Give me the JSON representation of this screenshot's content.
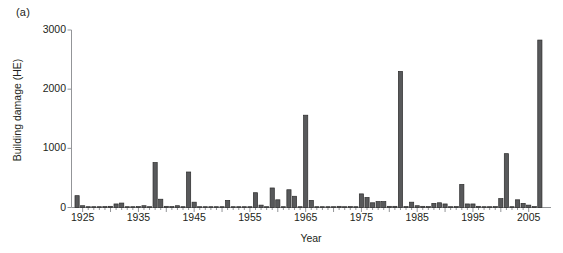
{
  "figure": {
    "panel_label": "(a)",
    "background": "#ffffff"
  },
  "chart_data": {
    "type": "bar",
    "title": "",
    "panel_label": "(a)",
    "xlabel": "Year",
    "ylabel": "Building damage (HE)",
    "xlim": [
      1923,
      2009
    ],
    "ylim": [
      0,
      3000
    ],
    "yticks": [
      0,
      1000,
      2000,
      3000
    ],
    "xticks": [
      1925,
      1930,
      1935,
      1940,
      1945,
      1950,
      1955,
      1960,
      1965,
      1970,
      1975,
      1980,
      1985,
      1990,
      1995,
      2000,
      2005
    ],
    "xtick_labels_shown": [
      1925,
      1935,
      1945,
      1955,
      1965,
      1975,
      1985,
      1995,
      2005
    ],
    "minor_xticks_interval": 1,
    "grid": false,
    "legend": null,
    "bar_color": "#58595b",
    "bar_edge_color": "#2b2b2b",
    "axis_color": "#939598",
    "categories": [
      1924,
      1925,
      1926,
      1927,
      1928,
      1929,
      1930,
      1931,
      1932,
      1933,
      1934,
      1935,
      1936,
      1937,
      1938,
      1939,
      1940,
      1941,
      1942,
      1943,
      1944,
      1945,
      1946,
      1947,
      1948,
      1949,
      1950,
      1951,
      1952,
      1953,
      1954,
      1955,
      1956,
      1957,
      1958,
      1959,
      1960,
      1961,
      1962,
      1963,
      1964,
      1965,
      1966,
      1967,
      1968,
      1969,
      1970,
      1971,
      1972,
      1973,
      1974,
      1975,
      1976,
      1977,
      1978,
      1979,
      1980,
      1981,
      1982,
      1983,
      1984,
      1985,
      1986,
      1987,
      1988,
      1989,
      1990,
      1991,
      1992,
      1993,
      1994,
      1995,
      1996,
      1997,
      1998,
      1999,
      2000,
      2001,
      2002,
      2003,
      2004,
      2005,
      2006,
      2007
    ],
    "values": [
      200,
      30,
      10,
      10,
      10,
      15,
      20,
      60,
      75,
      10,
      10,
      15,
      30,
      10,
      760,
      140,
      20,
      15,
      30,
      10,
      600,
      90,
      10,
      10,
      10,
      10,
      10,
      120,
      10,
      10,
      10,
      10,
      250,
      40,
      10,
      330,
      130,
      10,
      300,
      190,
      10,
      1560,
      120,
      10,
      10,
      10,
      10,
      20,
      10,
      15,
      10,
      230,
      170,
      80,
      100,
      100,
      20,
      20,
      2300,
      15,
      90,
      30,
      20,
      15,
      70,
      80,
      60,
      10,
      15,
      390,
      60,
      60,
      20,
      10,
      10,
      15,
      150,
      910,
      10,
      130,
      70,
      40,
      15,
      2830
    ]
  }
}
